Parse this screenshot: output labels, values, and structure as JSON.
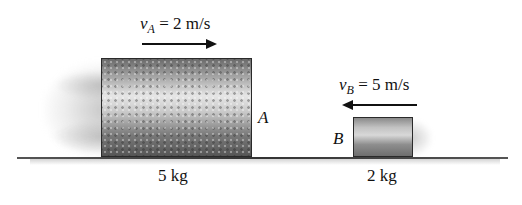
{
  "diagram": {
    "type": "collision-two-blocks",
    "ground": {
      "color": "#333333"
    },
    "blocks": [
      {
        "id": "A",
        "letter": "A",
        "mass_label": "5 kg",
        "velocity": {
          "symbol": "v",
          "subscript": "A",
          "equals_text": " = 2 m/s",
          "direction": "right"
        }
      },
      {
        "id": "B",
        "letter": "B",
        "mass_label": "2 kg",
        "velocity": {
          "symbol": "v",
          "subscript": "B",
          "equals_text": " = 5 m/s",
          "direction": "left"
        }
      }
    ]
  }
}
